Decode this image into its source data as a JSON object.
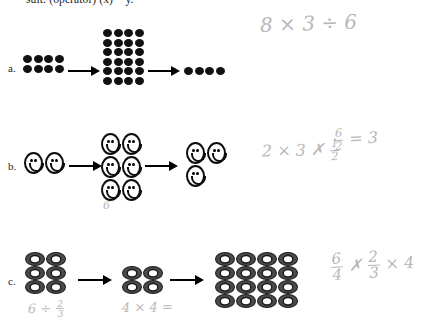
{
  "document": {
    "header_text": "sult: (operator) (x) = y.",
    "background_color": "#ffffff",
    "ink_color": "#111111",
    "pencil_color": "#a9a9a9"
  },
  "rows": [
    {
      "label": "a.",
      "icon_type": "dot",
      "groups": [
        {
          "name": "start-group",
          "rows": 2,
          "cols": 4,
          "count": 8
        },
        {
          "name": "middle-group",
          "rows": 6,
          "cols": 4,
          "count": 24
        },
        {
          "name": "end-group",
          "rows": 1,
          "cols": 4,
          "count": 4
        }
      ],
      "annotations": [
        {
          "name": "equation",
          "text": "8 × 3 ÷ 6"
        }
      ]
    },
    {
      "label": "b.",
      "icon_type": "smiley",
      "groups": [
        {
          "name": "start-group",
          "rows": 1,
          "cols": 2,
          "count": 2
        },
        {
          "name": "middle-group",
          "rows": 3,
          "cols": 2,
          "count": 6
        },
        {
          "name": "end-group",
          "rows": 2,
          "cols": 2,
          "count": 3
        }
      ],
      "annotations": [
        {
          "name": "count-note",
          "text": "6"
        },
        {
          "name": "equation",
          "text": "2 × 3 ✗"
        },
        {
          "name": "fraction-half",
          "num": "1",
          "den": "2"
        },
        {
          "name": "result-fraction",
          "num": "6",
          "den": "2"
        },
        {
          "name": "result-value",
          "text": "= 3"
        }
      ]
    },
    {
      "label": "c.",
      "icon_type": "donut",
      "groups": [
        {
          "name": "start-group",
          "rows": 3,
          "cols": 2,
          "count": 6
        },
        {
          "name": "middle-group",
          "rows": 2,
          "cols": 2,
          "count": 4
        },
        {
          "name": "end-group",
          "rows": 4,
          "cols": 4,
          "count": 16
        }
      ],
      "annotations": [
        {
          "name": "note-left",
          "text": "6  ÷"
        },
        {
          "name": "fraction-two-thirds",
          "num": "2",
          "den": "3"
        },
        {
          "name": "note-mid",
          "text": "4 × 4 ="
        },
        {
          "name": "fraction-six-fourths",
          "num": "6",
          "den": "4"
        },
        {
          "name": "cross-out",
          "text": "✗"
        },
        {
          "name": "fraction-two-thirds-b",
          "num": "2",
          "den": "3"
        },
        {
          "name": "times-four",
          "text": "× 4"
        }
      ]
    }
  ]
}
